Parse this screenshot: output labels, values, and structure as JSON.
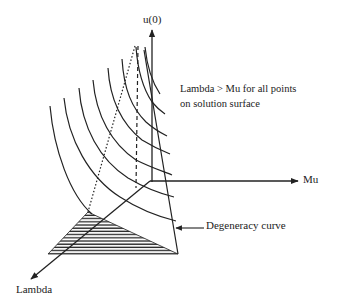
{
  "figure": {
    "type": "3d-solution-surface-sketch",
    "axes": {
      "vertical": {
        "label": "u(0)"
      },
      "horizontal": {
        "label": "Mu"
      },
      "depth": {
        "label": "Lambda"
      }
    },
    "annotations": {
      "note_line1": "Lambda > Mu for all points",
      "note_line2": "on solution surface",
      "degeneracy_label": "Degeneracy curve"
    },
    "elements": {
      "level_curves_count": 8,
      "has_dotted_guide": true,
      "has_dashed_guide": true,
      "has_hatched_region": true
    },
    "colors": {
      "ink": "#222222",
      "background": "#ffffff"
    }
  }
}
